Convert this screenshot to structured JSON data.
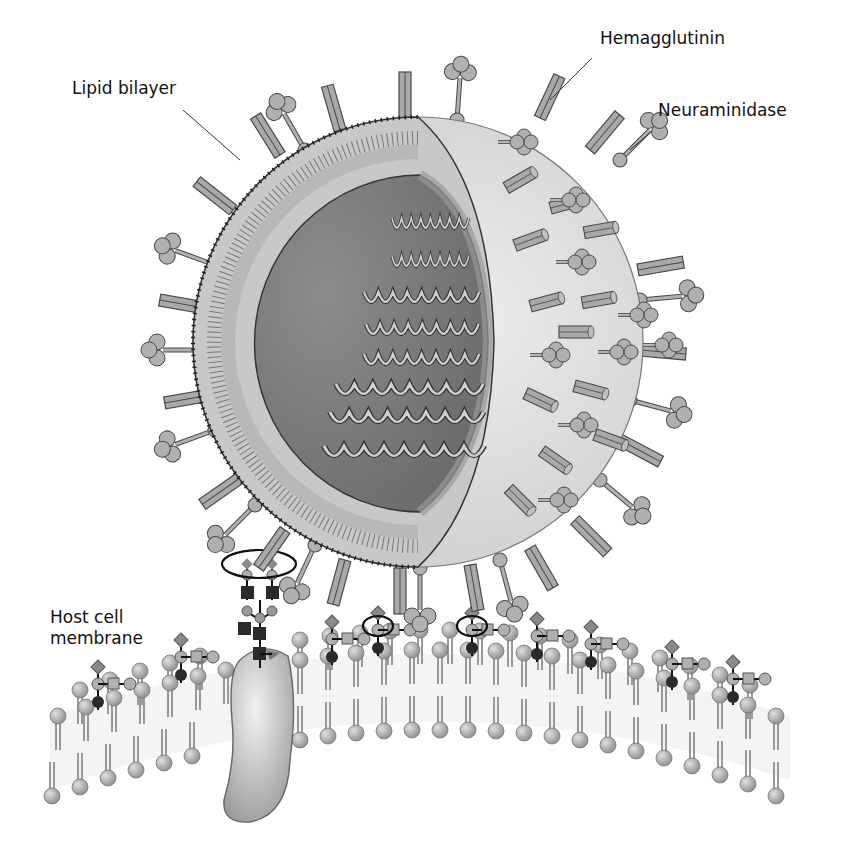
{
  "diagram": {
    "labels": {
      "hemagglutinin": "Hemagglutinin",
      "neuraminidase": "Neuraminidase",
      "lipid_bilayer": "Lipid bilayer",
      "host_membrane_line1": "Host cell",
      "host_membrane_line2": "membrane"
    },
    "components": [
      {
        "id": "virion",
        "name": "Viral particle (cutaway sphere)"
      },
      {
        "id": "rna_segments",
        "name": "Helical RNA segments",
        "count": 8
      },
      {
        "id": "hemagglutinin_spikes",
        "name": "Hemagglutinin rod spikes"
      },
      {
        "id": "neuraminidase_spikes",
        "name": "Neuraminidase lollipop spikes"
      },
      {
        "id": "viral_envelope",
        "name": "Lipid bilayer envelope"
      },
      {
        "id": "host_bilayer",
        "name": "Host cell lipid bilayer"
      },
      {
        "id": "transmembrane_glycoprotein",
        "name": "Glycosylated membrane protein"
      },
      {
        "id": "sialic_receptors",
        "name": "Sialylated glycan receptors",
        "count": 9
      },
      {
        "id": "binding_sites",
        "name": "Circled HA-receptor binding sites",
        "count": 3
      }
    ],
    "colors": {
      "background": "#ffffff",
      "spike_fill": "#a8a8a8",
      "spike_stroke": "#555555",
      "core_dark": "#7a7a7a",
      "envelope_light": "#d4d4d4",
      "membrane_head": "#b0b0b0",
      "receptor_dark": "#2a2a2a",
      "text": "#111111"
    }
  }
}
